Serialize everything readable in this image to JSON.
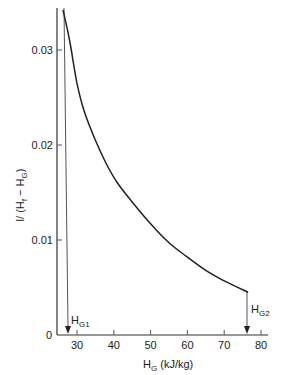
{
  "chart_data": {
    "type": "line",
    "title": "",
    "xlabel": "H_G (kJ/kg)",
    "xlabel_main": "H",
    "xlabel_sub": "G",
    "xlabel_unit": " (kJ/kg)",
    "ylabel": "1/(H_f − H_G)",
    "ylabel_text": "l/ (H",
    "ylabel_sub1": "f",
    "ylabel_mid": " − H",
    "ylabel_sub2": "G",
    "ylabel_end": ")",
    "xlim": [
      22,
      85
    ],
    "ylim": [
      0,
      0.034
    ],
    "xticks": [
      30,
      40,
      50,
      60,
      70,
      80
    ],
    "xtick_labels": [
      "30",
      "40",
      "50",
      "60",
      "70",
      "80"
    ],
    "yticks": [
      0,
      0.01,
      0.02,
      0.03
    ],
    "ytick_labels": [
      "0",
      "0.01",
      "0.02",
      "0.03"
    ],
    "grid": false,
    "series": [
      {
        "name": "1/(Hf - HG)",
        "x": [
          27.2,
          28,
          30,
          32,
          35,
          38,
          41,
          45,
          50,
          55,
          60,
          65,
          70,
          76.5
        ],
        "y": [
          0.0335,
          0.031,
          0.0265,
          0.0235,
          0.0205,
          0.018,
          0.016,
          0.014,
          0.0117,
          0.0097,
          0.0082,
          0.0068,
          0.0057,
          0.0045
        ]
      }
    ],
    "annotations": [
      {
        "label": "H",
        "sub": "G1",
        "x": 27.5,
        "note": "lower integration limit, arrow pointing to x-axis"
      },
      {
        "label": "H",
        "sub": "G2",
        "x": 76.5,
        "note": "upper integration limit, arrow pointing to x-axis"
      }
    ]
  }
}
